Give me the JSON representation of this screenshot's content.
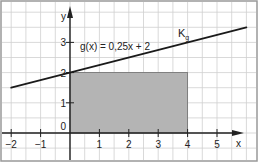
{
  "chart_data": {
    "type": "line",
    "title": "",
    "xlabel": "x",
    "ylabel": "y",
    "xlim": [
      -2.4,
      6.3
    ],
    "ylim": [
      -0.9,
      4.4
    ],
    "grid": true,
    "grid_minor_step": 0.5,
    "x_ticks": [
      -2,
      -1,
      1,
      2,
      3,
      4,
      5
    ],
    "x_tick_labels": [
      "−2",
      "−1",
      "1",
      "2",
      "3",
      "4",
      "5"
    ],
    "y_ticks": [
      0,
      1,
      2,
      3
    ],
    "y_tick_labels": [
      "0",
      "1",
      "2",
      "3"
    ],
    "series": [
      {
        "name": "K_g",
        "function": "g(x) = 0,25x + 2",
        "slope": 0.25,
        "intercept": 2,
        "x": [
          -2,
          6
        ],
        "y": [
          1.5,
          3.5
        ]
      }
    ],
    "shaded_region": {
      "x_from": 0,
      "x_to": 4,
      "y_from": 0,
      "y_to": 2,
      "color": "#b4b4b4"
    },
    "annotations": [
      {
        "text": "g(x) = 0,25x + 2",
        "x": 0.3,
        "y": 2.6
      },
      {
        "text": "K",
        "subscript": "g",
        "x": 4.5,
        "y": 3.2
      }
    ]
  },
  "labels": {
    "function_label": "g(x) = 0,25x + 2",
    "curve_name": "K",
    "curve_sub": "g",
    "x_axis": "x",
    "y_axis": "y",
    "x_ticks": [
      "−2",
      "−1",
      "1",
      "2",
      "3",
      "4",
      "5"
    ],
    "y_ticks": [
      "0",
      "1",
      "2",
      "3"
    ]
  },
  "colors": {
    "grid": "#cfcfcf",
    "axis": "#222222",
    "line": "#1a1a1a",
    "shade": "#b4b4b4",
    "shade_border": "#6e6e6e",
    "frame": "#999999"
  }
}
